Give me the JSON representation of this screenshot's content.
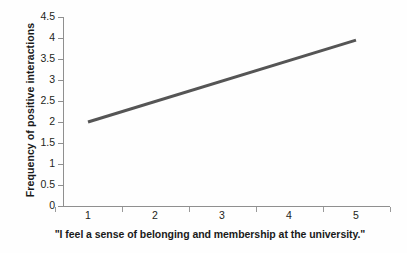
{
  "chart_data": {
    "type": "line",
    "title": "",
    "subtitle": "",
    "xlabel": "\"I feel a sense of belonging and membership at the university.\"",
    "ylabel": "Frequency of positive interactions",
    "x": [
      1,
      5
    ],
    "series": [
      {
        "name": "trend",
        "values": [
          2.0,
          3.95
        ],
        "color": "#555555",
        "linewidth": 3
      }
    ],
    "xticks": [
      "1",
      "2",
      "3",
      "4",
      "5"
    ],
    "yticks": [
      "0",
      "0.5",
      "1",
      "1.5",
      "2",
      "2.5",
      "3",
      "3.5",
      "4",
      "4.5"
    ],
    "xlim": [
      0.6,
      5.65
    ],
    "ylim": [
      0,
      4.5
    ],
    "grid": false,
    "legend": null,
    "axis_color": "#8f8f8f",
    "text_color": "#231f20",
    "background": "#fefefe"
  }
}
